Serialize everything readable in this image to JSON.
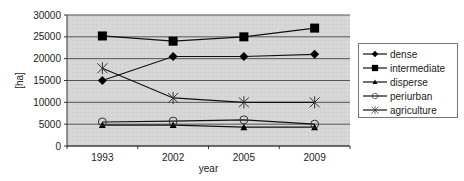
{
  "chart_data": {
    "type": "line",
    "title": "",
    "xlabel": "year",
    "ylabel": "[ha]",
    "categories": [
      "1993",
      "2002",
      "2005",
      "2009"
    ],
    "ylim": [
      0,
      30000
    ],
    "yticks": [
      0,
      5000,
      10000,
      15000,
      20000,
      25000,
      30000
    ],
    "ytick_labels": [
      "0",
      "5000",
      "10000",
      "15000",
      "20000",
      "25000",
      "30000"
    ],
    "grid": true,
    "legend_position": "right",
    "series": [
      {
        "name": "dense",
        "marker": "diamond",
        "values": [
          15000,
          20500,
          20500,
          21000
        ]
      },
      {
        "name": "intermediate",
        "marker": "square",
        "values": [
          25200,
          24000,
          25000,
          27000
        ]
      },
      {
        "name": "disperse",
        "marker": "triangle",
        "values": [
          4800,
          4800,
          4300,
          4300
        ]
      },
      {
        "name": "periurban",
        "marker": "circle",
        "values": [
          5500,
          5700,
          6000,
          5000
        ]
      },
      {
        "name": "agriculture",
        "marker": "asterisk",
        "values": [
          17800,
          11000,
          10000,
          10000
        ]
      }
    ]
  }
}
